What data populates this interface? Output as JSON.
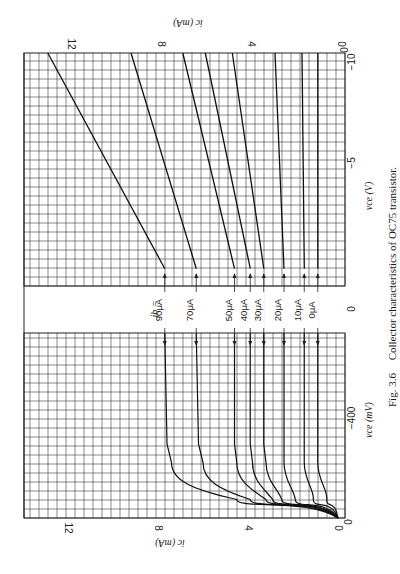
{
  "figure": {
    "caption_label": "Fig. 3.6",
    "caption_text": "Collector characteristics of OC75 transistor.",
    "orientation": "rotated 90° clockwise on page"
  },
  "axes": {
    "ic_label": "iₑ (mA)",
    "ic_label_text": "ic (mA)",
    "ic_ticks": [
      "12",
      "8",
      "4",
      "0"
    ],
    "vce_right_label": "vce (V)",
    "vce_right_ticks": [
      "0",
      "−5",
      "−10"
    ],
    "vce_left_label": "vce (mV)",
    "vce_left_ticks": [
      "0",
      "−400"
    ],
    "ib_prefix": "ib ="
  },
  "colors": {
    "grid": "#3a3a3a",
    "curve": "#111111",
    "background": "#ffffff"
  },
  "chart_data": {
    "type": "line",
    "title": "Collector characteristics of OC75 transistor",
    "xlabel": "vce",
    "ylabel": "ic (mA)",
    "ylim": [
      0,
      13
    ],
    "grid": true,
    "legend_position": "inline labels between panels",
    "panels": [
      {
        "name": "low-voltage region",
        "x_unit": "mV",
        "x_ticks": [
          0,
          -400
        ],
        "xlim": [
          0,
          -500
        ],
        "series": [
          {
            "name": "ib = 90μA",
            "x": [
              0,
              -50,
              -100,
              -150,
              -200,
              -500
            ],
            "y": [
              0,
              4.5,
              6.8,
              7.4,
              7.6,
              7.7
            ]
          },
          {
            "name": "ib = 70μA",
            "x": [
              0,
              -50,
              -100,
              -150,
              -200,
              -500
            ],
            "y": [
              0,
              3.9,
              5.6,
              6.0,
              6.2,
              6.3
            ]
          },
          {
            "name": "ib = 50μA",
            "x": [
              0,
              -50,
              -100,
              -150,
              -200,
              -500
            ],
            "y": [
              0,
              3.2,
              4.2,
              4.5,
              4.6,
              4.6
            ]
          },
          {
            "name": "ib = 40μA",
            "x": [
              0,
              -50,
              -100,
              -150,
              -200,
              -500
            ],
            "y": [
              0,
              2.9,
              3.6,
              3.8,
              3.9,
              3.9
            ]
          },
          {
            "name": "ib = 30μA",
            "x": [
              0,
              -50,
              -100,
              -150,
              -200,
              -500
            ],
            "y": [
              0,
              2.5,
              3.0,
              3.2,
              3.3,
              3.3
            ]
          },
          {
            "name": "ib = 20μA",
            "x": [
              0,
              -50,
              -100,
              -150,
              -200,
              -500
            ],
            "y": [
              0,
              1.9,
              2.3,
              2.4,
              2.4,
              2.4
            ]
          },
          {
            "name": "ib = 10μA",
            "x": [
              0,
              -50,
              -100,
              -150,
              -200,
              -500
            ],
            "y": [
              0,
              1.1,
              1.4,
              1.5,
              1.5,
              1.5
            ]
          },
          {
            "name": "ib = 0μA",
            "x": [
              0,
              -50,
              -100,
              -150,
              -200,
              -500
            ],
            "y": [
              0,
              0.5,
              0.8,
              0.9,
              0.9,
              0.9
            ]
          }
        ]
      },
      {
        "name": "high-voltage region",
        "x_unit": "V",
        "x_ticks": [
          0,
          -5,
          -10
        ],
        "xlim": [
          0,
          -13.5
        ],
        "series": [
          {
            "name": "ib = 90μA",
            "x": [
              -1,
              -13.5
            ],
            "y": [
              7.7,
              12.9
            ]
          },
          {
            "name": "ib = 70μA",
            "x": [
              -1,
              -13.5
            ],
            "y": [
              6.3,
              9.2
            ]
          },
          {
            "name": "ib = 50μA",
            "x": [
              -1,
              -13.5
            ],
            "y": [
              4.6,
              6.9
            ]
          },
          {
            "name": "ib = 40μA",
            "x": [
              -1,
              -13.5
            ],
            "y": [
              3.9,
              5.9
            ]
          },
          {
            "name": "ib = 30μA",
            "x": [
              -1,
              -13.5
            ],
            "y": [
              3.3,
              4.7
            ]
          },
          {
            "name": "ib = 20μA",
            "x": [
              -1,
              -13.5
            ],
            "y": [
              2.4,
              2.8
            ]
          },
          {
            "name": "ib = 10μA",
            "x": [
              -1,
              -13.5
            ],
            "y": [
              1.5,
              1.6
            ]
          },
          {
            "name": "ib = 0μA",
            "x": [
              -1,
              -13.5
            ],
            "y": [
              0.9,
              0.9
            ]
          }
        ]
      }
    ],
    "ib_labels": [
      "90μA",
      "70μA",
      "50μA",
      "40μA",
      "30μA",
      "20μA",
      "10μA",
      "0μA"
    ]
  }
}
